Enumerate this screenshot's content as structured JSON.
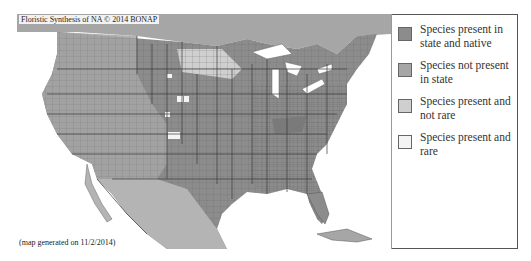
{
  "map": {
    "credit": "Floristic Synthesis of NA © 2014 BONAP",
    "generated": "(map generated on 11/2/2014)",
    "colors": {
      "native": "#8c8c8c",
      "not_present": "#a6a6a6",
      "present_not_rare": "#c8c8c8",
      "present_rare": "#f4f4f4",
      "water": "#ffffff",
      "borders": "#555555"
    }
  },
  "legend": {
    "items": [
      {
        "label": "Species present in state and native",
        "color": "#8c8c8c"
      },
      {
        "label": "Species not present in state",
        "color": "#a6a6a6"
      },
      {
        "label": "Species present and not rare",
        "color": "#cfcfcf"
      },
      {
        "label": "Species present and rare",
        "color": "#f4f4f4"
      }
    ]
  }
}
